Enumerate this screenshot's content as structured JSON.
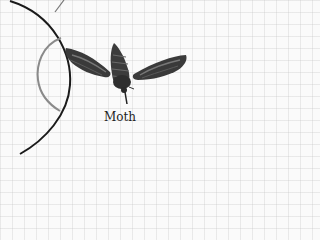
{
  "diagram": {
    "label": "Moth",
    "colors": {
      "background": "#fafafa",
      "grid": "#d8d8d8",
      "outer_arc": "#1a1a1a",
      "inner_arc": "#8a8a8a",
      "moth_dark": "#2a2a2a",
      "moth_mid": "#555555",
      "moth_light": "#8a8a8a"
    },
    "elements": [
      "outer-arc",
      "inner-arc",
      "top-line",
      "moth-illustration",
      "moth-label"
    ]
  }
}
